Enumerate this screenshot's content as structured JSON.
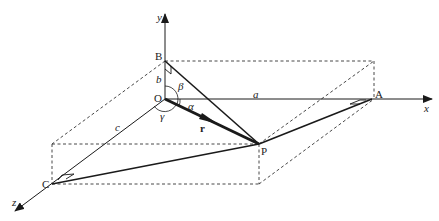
{
  "figure": {
    "axes": {
      "x": "x",
      "y": "y",
      "z": "z"
    },
    "points": {
      "origin": "O",
      "A": "A",
      "B": "B",
      "C": "C",
      "P": "P"
    },
    "lengths": {
      "a": "a",
      "b": "b",
      "c": "c"
    },
    "angles": {
      "alpha": "α",
      "beta": "β",
      "gamma": "γ"
    },
    "vector": "r",
    "colors": {
      "line": "#1a1a1a",
      "background": "#ffffff"
    }
  }
}
